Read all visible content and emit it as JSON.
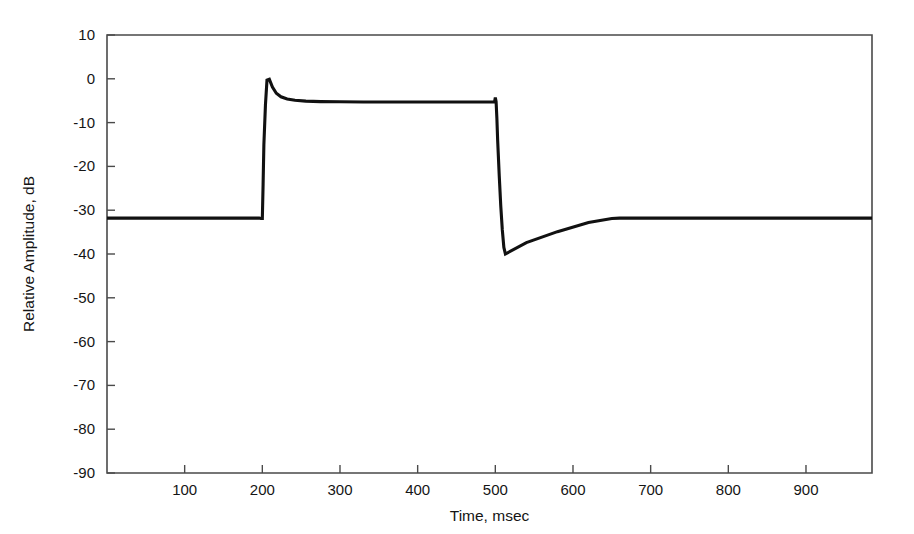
{
  "chart_data": {
    "type": "line",
    "title": "",
    "xlabel": "Time, msec",
    "ylabel": "Relative Amplitude, dB",
    "xlim": [
      0,
      985
    ],
    "ylim": [
      -90,
      10
    ],
    "xticks": [
      100,
      200,
      300,
      400,
      500,
      600,
      700,
      800,
      900
    ],
    "xtick_labels": [
      "100",
      "200",
      "300",
      "400",
      "500",
      "600",
      "700",
      "800",
      "900"
    ],
    "yticks": [
      10,
      0,
      -10,
      -20,
      -30,
      -40,
      -50,
      -60,
      -70,
      -80,
      -90
    ],
    "ytick_labels": [
      "10",
      "0",
      "-10",
      "-20",
      "-30",
      "-40",
      "-50",
      "-60",
      "-70",
      "-80",
      "-90"
    ],
    "grid": false,
    "legend": false,
    "line_color": "#111111",
    "axis_color": "#4a4a4a",
    "background": "#ffffff",
    "series": [
      {
        "name": "relative amplitude envelope",
        "x": [
          0,
          60,
          120,
          180,
          196,
          198,
          200,
          201,
          202,
          204,
          206,
          209,
          213,
          218,
          224,
          232,
          242,
          256,
          275,
          300,
          330,
          370,
          410,
          450,
          480,
          495,
          499,
          500,
          501,
          502,
          503,
          505,
          507,
          509,
          511,
          513,
          540,
          580,
          620,
          650,
          660,
          680,
          720,
          780,
          850,
          920,
          985
        ],
        "y": [
          -31.8,
          -31.8,
          -31.8,
          -31.8,
          -31.8,
          -31.9,
          -31.9,
          -24.0,
          -15.0,
          -6.0,
          -0.3,
          -0.1,
          -1.9,
          -3.3,
          -4.1,
          -4.6,
          -4.9,
          -5.1,
          -5.2,
          -5.25,
          -5.3,
          -5.3,
          -5.3,
          -5.3,
          -5.3,
          -5.3,
          -5.3,
          -4.3,
          -5.2,
          -9.0,
          -14.0,
          -22.0,
          -29.0,
          -34.5,
          -38.5,
          -40.0,
          -37.4,
          -34.9,
          -32.8,
          -31.9,
          -31.8,
          -31.8,
          -31.8,
          -31.8,
          -31.8,
          -31.8,
          -31.8
        ],
        "annotations": [
          {
            "label": "initial noise floor",
            "value": -31.8
          },
          {
            "label": "onset overshoot peak",
            "value": -0.1,
            "x": 209
          },
          {
            "label": "steady plateau",
            "value": -5.3
          },
          {
            "label": "offset blip",
            "value": -4.3,
            "x": 500
          },
          {
            "label": "minimum after decay",
            "value": -40.0,
            "x": 513
          },
          {
            "label": "recovered noise floor",
            "value": -31.8,
            "x": 660
          }
        ]
      }
    ]
  }
}
